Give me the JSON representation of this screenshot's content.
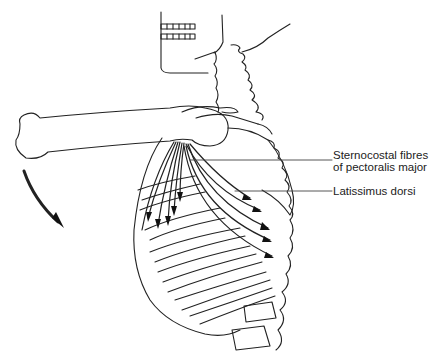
{
  "figure": {
    "labels": [
      {
        "id": "pectoralis",
        "lines": [
          "Sternocostal fibres",
          "of pectoralis major"
        ]
      },
      {
        "id": "latissimus",
        "text": "Latissimus dorsi"
      }
    ],
    "movement_arrow": "curved-arrow-down"
  }
}
